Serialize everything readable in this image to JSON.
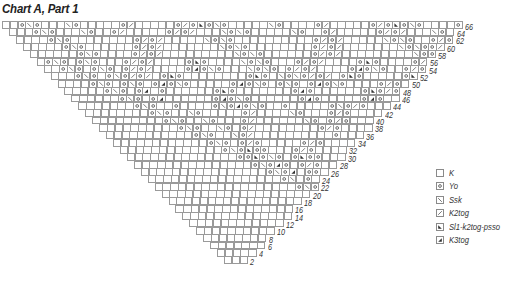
{
  "title": "Chart A, Part 1",
  "grid": {
    "top_left_x": 2,
    "top_y": 21,
    "cell_w": 7.8,
    "cell_h": 7.35,
    "top_row_cells": 59,
    "row_count": 33,
    "bottom_left_x": 224,
    "bottom_cells": 3
  },
  "row_labels": [
    "66",
    "64",
    "62",
    "60",
    "58",
    "56",
    "54",
    "52",
    "50",
    "48",
    "46",
    "44",
    "42",
    "40",
    "38",
    "36",
    "34",
    "32",
    "30",
    "28",
    "26",
    "24",
    "22",
    "20",
    "18",
    "16",
    "14",
    "12",
    "10",
    "8",
    "6",
    "4",
    "2"
  ],
  "rows": [
    "..o\\o...\\o.....o/.....o/o&o\\o.....\\o....o/.....o/o&o\\o....o/o.",
    "...o\\o...\\o..o/.....o/o/...\\o\\o.....\\o..o/.....o/o/...\\o..o/..",
    "....o\\o........o/o/.....\\o\\o..........o/o/.....\\o\\o..o/o..",
    ".....o\\o......o/o/.......\\o\\o........o/o/.......\\o\\oo/o.",
    "......o\\o....o/o/.........\\o\\o......o/o/.........\\oo/o.",
    ".o\\o.o\\o...o/o/....o&o....\\o\\o...o/o/....o&o....o/o.",
    "..o\\o.o\\o.o/o/....o4o\\o...\\o\\o.o/o/....o4o\\o..o/o",
    "...o\\o.o\\o/o/.o&o........o&o.\\o\\o/o/.o&o.....o&oo",
    "....o\\o.o\\o.o4o\\o.....o4o\\o.o\\o.o4o\\o....o/o",
    ".....o\\o.o4.o......o&o.......o4o......o&o/o",
    "......o\\o.o4......o4o\\o......o4o.....o4o",
    ".......o\\o..o....o\\o4o\\o..o.....o\\o/o",
    "........o\\o..\\o.....o/....\\o...o/o",
    ".........o\\o..\\o...o/......\\o.o/o",
    "..........o\\o..\\o.o/........o/o",
    "...........o\\o..\\o/..........o",
    "............o\\o.o/o.....o/o",
    ".............o\\o&oo...o/o",
    "..............oo&o\\o.o&oo",
    "...............o\\o4o.o/o",
    "................o\\o4.oo",
    ".................o\\.o",
    "..................o\\o",
    "...................oo",
    "...................o",
    "..................o",
    ".................o",
    "................o",
    "...............o",
    "..............o&o",
    ".............o.o",
    "............o.o",
    "...........o."
  ],
  "legend": {
    "items": [
      {
        "symbol": "blank",
        "label": "K"
      },
      {
        "symbol": "yo",
        "label": "Yo"
      },
      {
        "symbol": "ssk",
        "label": "Ssk"
      },
      {
        "symbol": "k2tog",
        "label": "K2tog"
      },
      {
        "symbol": "sk2p",
        "label": "Sl1-k2tog-psso"
      },
      {
        "symbol": "k3tog",
        "label": "K3tog"
      }
    ]
  },
  "colors": {
    "grid_line": "#9a9a9a",
    "symbol": "#333333",
    "text": "#333333"
  }
}
